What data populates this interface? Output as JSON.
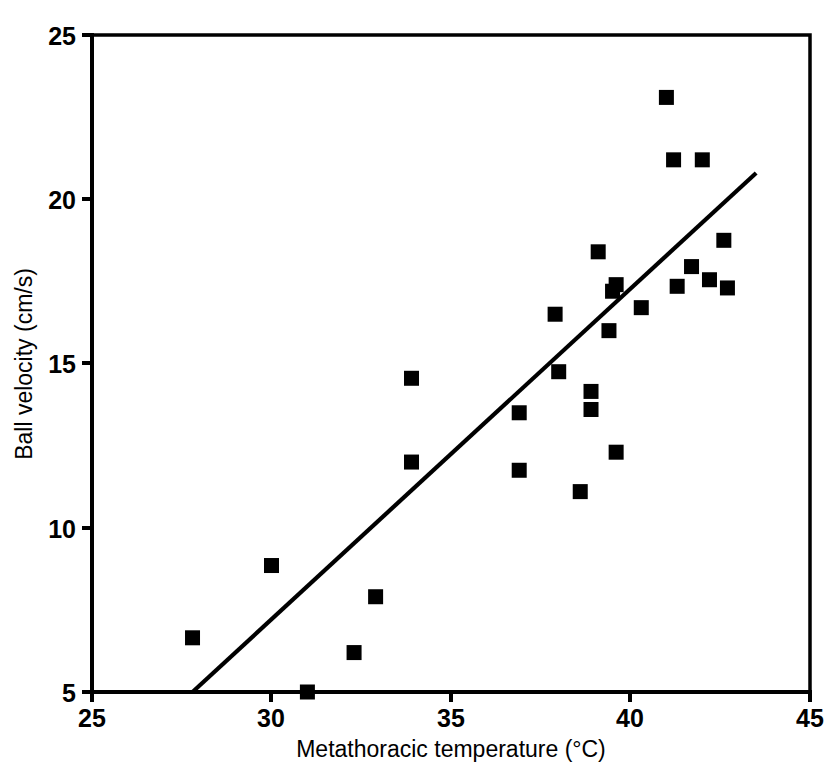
{
  "chart_data": {
    "type": "scatter",
    "title": "",
    "xlabel": "Metathoracic temperature (°C)",
    "ylabel": "Ball velocity (cm/s)",
    "xlim": [
      25,
      45
    ],
    "ylim": [
      5,
      25
    ],
    "xticks": [
      25,
      30,
      35,
      40,
      45
    ],
    "yticks": [
      5,
      10,
      15,
      20,
      25
    ],
    "xtick_labels": [
      "25",
      "30",
      "35",
      "40",
      "45"
    ],
    "ytick_labels": [
      "5",
      "10",
      "15",
      "20",
      "25"
    ],
    "grid": false,
    "legend": null,
    "marker": "filled-square",
    "marker_color": "#000000",
    "series": [
      {
        "name": "Observations",
        "x": [
          27.8,
          30.0,
          31.0,
          32.3,
          32.9,
          33.9,
          33.9,
          36.9,
          36.9,
          37.9,
          38.0,
          38.6,
          38.9,
          38.9,
          39.1,
          39.4,
          39.5,
          39.6,
          39.6,
          40.3,
          41.0,
          41.2,
          41.3,
          41.7,
          42.0,
          42.2,
          42.6,
          42.7
        ],
        "y": [
          6.65,
          8.85,
          5.0,
          6.2,
          7.9,
          14.55,
          12.0,
          13.5,
          11.75,
          16.5,
          14.75,
          11.1,
          14.15,
          13.6,
          18.4,
          16.0,
          17.2,
          17.4,
          12.3,
          16.7,
          23.1,
          21.2,
          17.35,
          17.95,
          21.2,
          17.55,
          18.75,
          17.3
        ]
      }
    ],
    "fit_line": {
      "name": "Least-squares regression line",
      "x": [
        27.8,
        43.5
      ],
      "y": [
        5.0,
        20.8
      ]
    }
  },
  "axes": {
    "x_axis_name": "x-axis",
    "y_axis_name": "y-axis"
  }
}
